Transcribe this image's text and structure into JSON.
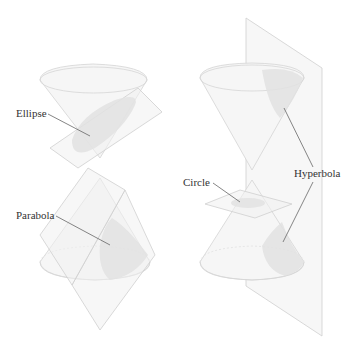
{
  "figure": {
    "left": {
      "labels": {
        "ellipse": "Ellipse",
        "parabola": "Parabola"
      }
    },
    "right": {
      "labels": {
        "circle": "Circle",
        "hyperbola": "Hyperbola"
      }
    }
  },
  "colors": {
    "background": "#ffffff",
    "cone_fill": "#f6f6f6",
    "edge": "#d4d4d4",
    "section": "#e2e2e2",
    "label_text": "#333333",
    "leader_line": "#666666"
  }
}
